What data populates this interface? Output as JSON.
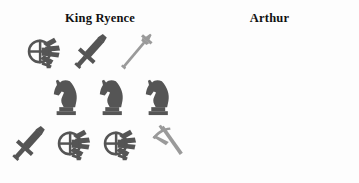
{
  "colors": {
    "background": "#fdfdfd",
    "icon_dark": "#555555",
    "icon_light": "#9a9a9a",
    "text": "#111111",
    "question_mark": "#1b1b1b"
  },
  "panels": [
    {
      "id": "king-ryence",
      "title": "King Ryence",
      "rows": [
        {
          "id": "left-row-1",
          "items": [
            {
              "icon": "crossbow-icon",
              "label": "crossbow",
              "shade": "dark"
            },
            {
              "icon": "sword-icon",
              "label": "sword",
              "shade": "dark"
            },
            {
              "icon": "spear-icon",
              "label": "spear",
              "shade": "light"
            }
          ]
        },
        {
          "id": "left-row-2",
          "items": [
            {
              "icon": "knight-chess-piece-icon",
              "label": "knight",
              "shade": "dark"
            },
            {
              "icon": "knight-chess-piece-icon",
              "label": "knight",
              "shade": "dark"
            },
            {
              "icon": "knight-chess-piece-icon",
              "label": "knight",
              "shade": "dark"
            }
          ]
        },
        {
          "id": "left-row-3",
          "items": [
            {
              "icon": "sword-icon",
              "label": "sword",
              "shade": "dark"
            },
            {
              "icon": "crossbow-icon",
              "label": "crossbow",
              "shade": "dark"
            },
            {
              "icon": "crossbow-icon",
              "label": "crossbow",
              "shade": "dark"
            },
            {
              "icon": "pickaxe-icon",
              "label": "pickaxe",
              "shade": "light"
            }
          ]
        }
      ]
    },
    {
      "id": "arthur",
      "title": "Arthur",
      "rows": [
        {
          "id": "right-row-1",
          "items": [
            {
              "icon": "pickaxe-icon",
              "label": "pickaxe",
              "shade": "light"
            },
            {
              "icon": "crossbow-icon",
              "label": "crossbow",
              "shade": "dark"
            }
          ]
        },
        {
          "id": "right-row-2",
          "items": [
            {
              "icon": "pickaxe-icon",
              "label": "pickaxe",
              "shade": "light"
            },
            {
              "icon": "pickaxe-icon",
              "label": "pickaxe",
              "shade": "light"
            },
            {
              "icon": "sword-icon",
              "label": "sword",
              "shade": "dark"
            }
          ]
        },
        {
          "id": "right-row-3",
          "items": [
            {
              "icon": "question-mark",
              "label": "?",
              "shade": "dark"
            }
          ]
        }
      ]
    }
  ],
  "question_mark_text": "?"
}
